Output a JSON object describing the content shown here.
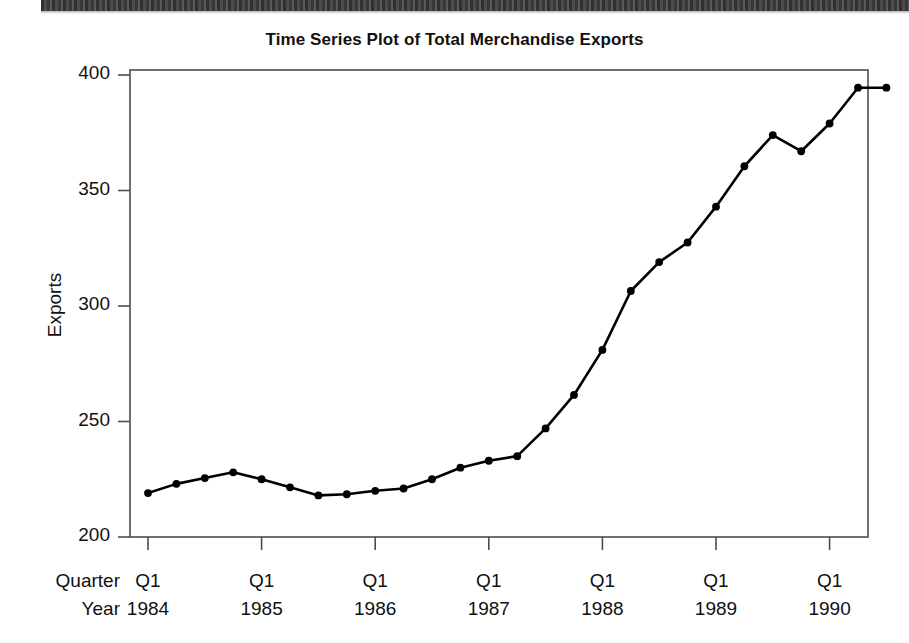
{
  "figure": {
    "title": "Time Series Plot of Total Merchandise Exports",
    "y_axis_title": "Exports",
    "row_label_quarter": "Quarter",
    "row_label_year": "Year",
    "line_color": "#000000",
    "marker_color": "#000000",
    "frame_color": "#4d4d4d",
    "background": "#ffffff"
  },
  "chart_data": {
    "type": "line",
    "title": "Time Series Plot of Total Merchandise Exports",
    "xlabel": "Quarter / Year",
    "ylabel": "Exports",
    "ylim": [
      200,
      400
    ],
    "yticks": [
      200,
      250,
      300,
      350,
      400
    ],
    "ytick_labels": [
      "200",
      "250",
      "300",
      "350",
      "400"
    ],
    "grid": false,
    "legend": null,
    "xtick_positions": [
      1,
      5,
      9,
      13,
      17,
      21,
      25
    ],
    "xtick_quarter_labels": [
      "Q1",
      "Q1",
      "Q1",
      "Q1",
      "Q1",
      "Q1",
      "Q1"
    ],
    "xtick_year_labels": [
      "1984",
      "1985",
      "1986",
      "1987",
      "1988",
      "1989",
      "1990"
    ],
    "x": [
      "Q1 1984",
      "Q2 1984",
      "Q3 1984",
      "Q4 1984",
      "Q1 1985",
      "Q2 1985",
      "Q3 1985",
      "Q4 1985",
      "Q1 1986",
      "Q2 1986",
      "Q3 1986",
      "Q4 1986",
      "Q1 1987",
      "Q2 1987",
      "Q3 1987",
      "Q4 1987",
      "Q1 1988",
      "Q2 1988",
      "Q3 1988",
      "Q4 1988",
      "Q1 1989",
      "Q2 1989",
      "Q3 1989",
      "Q4 1989",
      "Q1 1990",
      "Q2 1990",
      "Q3 1990"
    ],
    "values": [
      219,
      223,
      225.5,
      228,
      225,
      221.5,
      218,
      218.5,
      220,
      221,
      225,
      230,
      233,
      235,
      247,
      261.5,
      281,
      306.5,
      319,
      327.5,
      343,
      360.5,
      374,
      367,
      379,
      394.5,
      394.5
    ],
    "series": [
      {
        "name": "Total Merchandise Exports",
        "values": [
          219,
          223,
          225.5,
          228,
          225,
          221.5,
          218,
          218.5,
          220,
          221,
          225,
          230,
          233,
          235,
          247,
          261.5,
          281,
          306.5,
          319,
          327.5,
          343,
          360.5,
          374,
          367,
          379,
          394.5,
          394.5
        ]
      }
    ]
  },
  "geometry": {
    "plot_left": 130,
    "plot_right": 868,
    "plot_top": 70,
    "plot_bottom": 537,
    "x_first_tick": 148,
    "x_step_per_quarter": 28.4
  }
}
